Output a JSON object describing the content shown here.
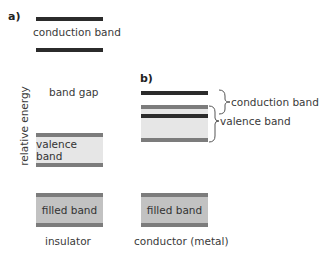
{
  "colors": {
    "conduction_bar": "#2b2b2b",
    "band_stripe": "#7c7c7c",
    "valence_fill": "#e6e6e6",
    "filled_fill": "#c2c2c2"
  },
  "panel_a": {
    "label": "a)",
    "conduction_label": "conduction band",
    "band_gap_label": "band gap",
    "valence_label": "valence band",
    "filled_label": "filled band",
    "caption": "insulator"
  },
  "panel_b": {
    "label": "b)",
    "conduction_label": "conduction band",
    "valence_label": "valence band",
    "filled_label": "filled band",
    "caption": "conductor (metal)"
  },
  "axis": {
    "ylabel": "relative energy"
  }
}
